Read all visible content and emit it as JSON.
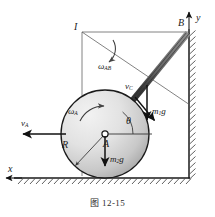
{
  "figure": {
    "caption": "图 12-15",
    "caption_number": "12-15",
    "domain": "mechanics-diagram"
  },
  "axes": {
    "y_label": "y",
    "x_label": "x",
    "y_axis_direction": "up",
    "x_axis_direction": "left"
  },
  "points": {
    "I": "I",
    "A": "A",
    "B": "B"
  },
  "labels": {
    "omega_AB": {
      "symbol": "ω",
      "sub": "AB"
    },
    "omega_A": {
      "symbol": "ω",
      "sub": "A"
    },
    "v_C": {
      "symbol": "v",
      "sub": "C"
    },
    "v_A": {
      "symbol": "v",
      "sub": "A"
    },
    "m1g": {
      "symbol": "m",
      "sub": "1",
      "tail": "g"
    },
    "m2g": {
      "symbol": "m",
      "sub": "2",
      "tail": "g"
    },
    "theta": "θ",
    "R": "R"
  },
  "geometry": {
    "disk_center": [
      105,
      134
    ],
    "disk_radius": 44,
    "point_B": [
      188,
      32
    ],
    "point_I": [
      82,
      32
    ],
    "angle_theta_deg": 51,
    "ground_y": 178,
    "wall_x": 189
  },
  "colors": {
    "line": "#1a1a1a",
    "rod_dark": "#4a4a4a",
    "rod_light": "#9a9a9a",
    "disk_light": "#ececec",
    "disk_dark": "#a9a9a9",
    "construction": "#555555",
    "hatch": "#3a3a3a",
    "caption": "#2a2a2a"
  }
}
